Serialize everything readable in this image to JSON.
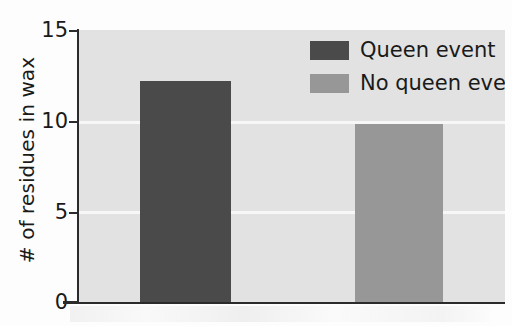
{
  "chart_data": {
    "type": "bar",
    "title": "",
    "subtitle": "",
    "xlabel": "",
    "ylabel": "# of residues in wax",
    "categories": [
      ""
    ],
    "series": [
      {
        "name": "Queen event",
        "values": [
          12.2
        ],
        "color": "#4a4a4a"
      },
      {
        "name": "No queen event",
        "values": [
          9.8
        ],
        "color": "#979797"
      }
    ],
    "ylim": [
      0,
      15
    ],
    "yticks": [
      0,
      5,
      10,
      15
    ],
    "ytick_labels": [
      "0",
      "5",
      "10",
      "15"
    ],
    "xticks": [],
    "xtick_labels": [],
    "grid": true,
    "gridlines_at": [
      5,
      10
    ],
    "legend_position": "top-right",
    "plot_background_color": "#e2e2e2",
    "gridline_color": "#f7f7f7",
    "axis_color": "#2b2b2b"
  },
  "axis": {
    "y_title": "# of residues in wax",
    "ticks": [
      {
        "value": 15,
        "label": "15"
      },
      {
        "value": 10,
        "label": "10"
      },
      {
        "value": 5,
        "label": "5"
      },
      {
        "value": 0,
        "label": "0"
      }
    ]
  },
  "legend": {
    "entries": [
      {
        "label": "Queen event",
        "color": "#4a4a4a"
      },
      {
        "label": "No queen event",
        "color": "#979797"
      }
    ]
  },
  "bars": [
    {
      "name": "Queen event",
      "value": 12.2,
      "color": "#4a4a4a"
    },
    {
      "name": "No queen event",
      "value": 9.8,
      "color": "#979797"
    }
  ]
}
